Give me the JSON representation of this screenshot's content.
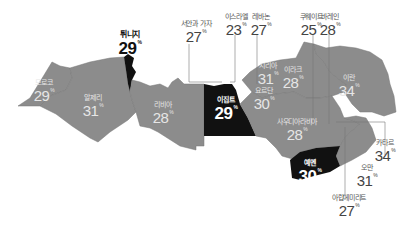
{
  "colors": {
    "land": "#8c8c8c",
    "highlight": "#111111",
    "leader_line": "#777777",
    "background": "#ffffff"
  },
  "percent_symbol": "%",
  "countries": {
    "morocco": {
      "name": "모로코",
      "value": "29",
      "highlighted": false
    },
    "algeria": {
      "name": "알제리",
      "value": "31",
      "highlighted": false
    },
    "tunisia": {
      "name": "튀니지",
      "value": "29",
      "highlighted": true
    },
    "libya": {
      "name": "리비아",
      "value": "28",
      "highlighted": false
    },
    "egypt": {
      "name": "이집트",
      "value": "29",
      "highlighted": true
    },
    "west_bank_gaza": {
      "name": "서안과 가자",
      "value": "27",
      "highlighted": false
    },
    "israel": {
      "name": "이스라엘",
      "value": "23",
      "highlighted": false
    },
    "lebanon": {
      "name": "레바논",
      "value": "27",
      "highlighted": false
    },
    "syria": {
      "name": "시리아",
      "value": "31",
      "highlighted": false
    },
    "jordan": {
      "name": "요르단",
      "value": "30",
      "highlighted": false
    },
    "iraq": {
      "name": "이라크",
      "value": "28",
      "highlighted": false
    },
    "kuwait": {
      "name": "쿠웨이트",
      "value": "25",
      "highlighted": false
    },
    "bahrain": {
      "name": "바레인",
      "value": "28",
      "highlighted": false
    },
    "iran": {
      "name": "이란",
      "value": "34",
      "highlighted": false
    },
    "saudi_arabia": {
      "name": "사우디아라비아",
      "value": "28",
      "highlighted": false
    },
    "qatar": {
      "name": "카타르",
      "value": "34",
      "highlighted": false
    },
    "oman": {
      "name": "오만",
      "value": "31",
      "highlighted": false
    },
    "uae": {
      "name": "아랍에미리트",
      "value": "27",
      "highlighted": false
    },
    "yemen": {
      "name": "예멘",
      "value": "30",
      "highlighted": true
    }
  }
}
